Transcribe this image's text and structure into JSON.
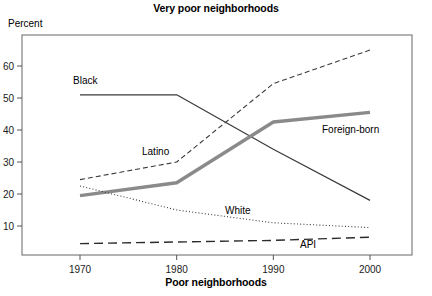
{
  "header": {
    "title": "Very poor neighborhoods",
    "y_axis_caption": "Percent",
    "bottom_caption": "Poor neighborhoods"
  },
  "labels": {
    "black": "Black",
    "latino": "Latino",
    "white": "White",
    "api": "API",
    "foreign_born": "Foreign-born"
  },
  "ticks": {
    "y": [
      "10",
      "20",
      "30",
      "40",
      "50",
      "60"
    ],
    "x": [
      "1970",
      "1980",
      "1990",
      "2000"
    ]
  },
  "colors": {
    "black_line": "#3a3a3a",
    "latino_line": "#3a3a3a",
    "white_line": "#3a3a3a",
    "api_line": "#2b2b2b",
    "foreign_born_line": "#8a8a8a",
    "axis": "#555555",
    "background": "#ffffff"
  },
  "chart_data": {
    "type": "line",
    "title": "Very poor neighborhoods",
    "subtitle": "",
    "xlabel": "Poor neighborhoods",
    "ylabel": "Percent",
    "x": [
      1970,
      1980,
      1990,
      2000
    ],
    "xlim": [
      1966,
      2004
    ],
    "ylim": [
      4,
      68
    ],
    "yticks": [
      10,
      20,
      30,
      40,
      50,
      60
    ],
    "xticks": [
      1970,
      1980,
      1990,
      2000
    ],
    "grid": false,
    "legend": "inline-annotations",
    "series": [
      {
        "name": "Black",
        "style": "solid-thin",
        "values": [
          51,
          51,
          34,
          18
        ]
      },
      {
        "name": "Latino",
        "style": "dashed",
        "values": [
          24.5,
          30,
          54.5,
          65
        ]
      },
      {
        "name": "Foreign-born",
        "style": "solid-thick-gray",
        "values": [
          19.5,
          23.5,
          42.5,
          45.5
        ]
      },
      {
        "name": "White",
        "style": "dotted",
        "values": [
          22.5,
          15,
          11,
          9.5
        ]
      },
      {
        "name": "API",
        "style": "long-dashed",
        "values": [
          4.5,
          5,
          5.5,
          6.5
        ]
      }
    ]
  }
}
